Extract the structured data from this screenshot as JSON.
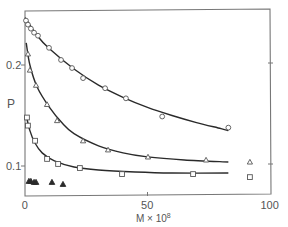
{
  "chart_data": {
    "type": "scatter",
    "title": "",
    "xlabel": "M × 10",
    "xlabel_superscript": "8",
    "ylabel": "P",
    "xlim": [
      0,
      100
    ],
    "ylim": [
      0.07,
      0.255
    ],
    "grid": false,
    "legend": "none",
    "x_ticks": [
      {
        "value": 0,
        "label": "0"
      },
      {
        "value": 50,
        "label": "50"
      },
      {
        "value": 100,
        "label": "100"
      }
    ],
    "y_ticks": [
      {
        "value": 0.1,
        "label": "0.1"
      },
      {
        "value": 0.2,
        "label": "0.2"
      }
    ],
    "series": [
      {
        "name": "open circles",
        "marker": "circle",
        "filled": false,
        "fitted_curve": true,
        "points": [
          [
            0.4,
            0.244
          ],
          [
            1.2,
            0.24
          ],
          [
            2.4,
            0.236
          ],
          [
            3.7,
            0.232
          ],
          [
            5.3,
            0.229
          ],
          [
            9.8,
            0.217
          ],
          [
            14.7,
            0.205
          ],
          [
            19.2,
            0.197
          ],
          [
            23.7,
            0.187
          ],
          [
            32.7,
            0.177
          ],
          [
            41.2,
            0.167
          ],
          [
            56.0,
            0.149
          ],
          [
            83.0,
            0.138
          ]
        ],
        "curve": [
          [
            0,
            0.247
          ],
          [
            5,
            0.229
          ],
          [
            10,
            0.216
          ],
          [
            20,
            0.196
          ],
          [
            30,
            0.18
          ],
          [
            40,
            0.168
          ],
          [
            50,
            0.158
          ],
          [
            60,
            0.15
          ],
          [
            70,
            0.143
          ],
          [
            80,
            0.137
          ],
          [
            83,
            0.135
          ]
        ]
      },
      {
        "name": "open triangles",
        "marker": "triangle",
        "filled": false,
        "fitted_curve": true,
        "points": [
          [
            1.2,
            0.211
          ],
          [
            2.0,
            0.195
          ],
          [
            4.5,
            0.18
          ],
          [
            9.0,
            0.161
          ],
          [
            13.1,
            0.145
          ],
          [
            23.7,
            0.125
          ],
          [
            33.9,
            0.116
          ],
          [
            50.2,
            0.109
          ],
          [
            73.9,
            0.106
          ],
          [
            91.8,
            0.104
          ]
        ],
        "curve": [
          [
            0.5,
            0.222
          ],
          [
            2,
            0.2
          ],
          [
            5,
            0.178
          ],
          [
            10,
            0.158
          ],
          [
            15,
            0.143
          ],
          [
            20,
            0.132
          ],
          [
            30,
            0.12
          ],
          [
            40,
            0.113
          ],
          [
            50,
            0.109
          ],
          [
            65,
            0.106
          ],
          [
            83,
            0.104
          ]
        ]
      },
      {
        "name": "open squares",
        "marker": "square",
        "filled": false,
        "fitted_curve": true,
        "points": [
          [
            0.8,
            0.148
          ],
          [
            1.2,
            0.14
          ],
          [
            4.1,
            0.125
          ],
          [
            9.0,
            0.107
          ],
          [
            13.5,
            0.102
          ],
          [
            22.4,
            0.098
          ],
          [
            39.6,
            0.092
          ],
          [
            68.6,
            0.092
          ],
          [
            91.8,
            0.089
          ]
        ],
        "curve": [
          [
            0.5,
            0.15
          ],
          [
            2,
            0.135
          ],
          [
            4,
            0.123
          ],
          [
            7,
            0.113
          ],
          [
            12,
            0.105
          ],
          [
            20,
            0.099
          ],
          [
            30,
            0.096
          ],
          [
            45,
            0.094
          ],
          [
            60,
            0.093
          ],
          [
            83,
            0.093
          ]
        ]
      },
      {
        "name": "filled triangles",
        "marker": "triangle",
        "filled": true,
        "fitted_curve": false,
        "points": [
          [
            1.6,
            0.085
          ],
          [
            2.4,
            0.085
          ],
          [
            3.7,
            0.084
          ],
          [
            4.5,
            0.084
          ],
          [
            11.0,
            0.084
          ],
          [
            15.5,
            0.082
          ]
        ]
      }
    ]
  }
}
